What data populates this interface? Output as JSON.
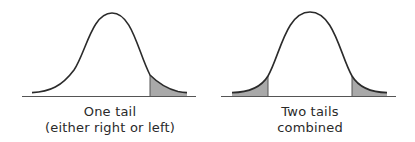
{
  "diagrams": [
    {
      "id": "one-tail",
      "caption_line1": "One tail",
      "caption_line2": "(either right or left)",
      "shaded_regions": [
        "right"
      ]
    },
    {
      "id": "two-tails",
      "caption_line1": "Two tails",
      "caption_line2": "combined",
      "shaded_regions": [
        "left",
        "right"
      ]
    }
  ],
  "colors": {
    "curve": "#2b2b2b",
    "baseline": "#555555",
    "shade": "#a9a9a9",
    "text": "#2a2a2a"
  }
}
